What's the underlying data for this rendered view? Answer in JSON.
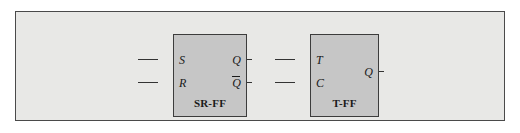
{
  "figure": {
    "type": "logic-diagram",
    "background_color": "#ffffff",
    "panel_color": "#e8e8e6",
    "block_color": "#c6c6c6",
    "line_color": "#333333",
    "border_color": "#3c3c3c"
  },
  "blocks": [
    {
      "id": "sr-ff",
      "name": "SR-FF",
      "inputs": [
        {
          "label": "S"
        },
        {
          "label": "R"
        }
      ],
      "outputs": [
        {
          "label": "Q",
          "inverted": false
        },
        {
          "label": "Q",
          "inverted": true
        }
      ]
    },
    {
      "id": "t-ff",
      "name": "T-FF",
      "inputs": [
        {
          "label": "T"
        },
        {
          "label": "C"
        }
      ],
      "outputs": [
        {
          "label": "Q",
          "inverted": false
        }
      ]
    }
  ]
}
